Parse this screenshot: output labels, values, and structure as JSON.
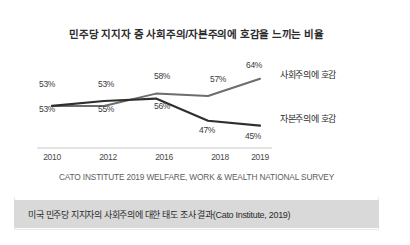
{
  "chart_data": {
    "type": "line",
    "title": "민주당 지지자 중 사회주의/자본주의에 호감을 느끼는 비율",
    "xlabel": "",
    "ylabel": "",
    "grid": false,
    "legend_position": "line-end-right",
    "ylim": [
      40,
      70
    ],
    "categories": [
      "2010",
      "2012",
      "2016",
      "2018",
      "2019"
    ],
    "series": [
      {
        "name": "사회주의에 호감",
        "color": "#6d6d6d",
        "values": [
          53,
          53,
          58,
          57,
          64
        ],
        "value_labels": [
          "53%",
          "53%",
          "58%",
          "57%",
          "64%"
        ]
      },
      {
        "name": "자본주의에 호감",
        "color": "#2f2f2f",
        "values": [
          53,
          55,
          56,
          47,
          45
        ],
        "value_labels": [
          "53%",
          "55%",
          "56%",
          "47%",
          "45%"
        ]
      }
    ],
    "source": "CATO INSTITUTE 2019 WELFARE, WORK & WEALTH NATIONAL SURVEY"
  },
  "caption": {
    "text": "미국 민주당 지지자의 사회주의에 대한 태도 조사 결과(Cato Institute, 2019)",
    "background": "#d9d9d9"
  }
}
